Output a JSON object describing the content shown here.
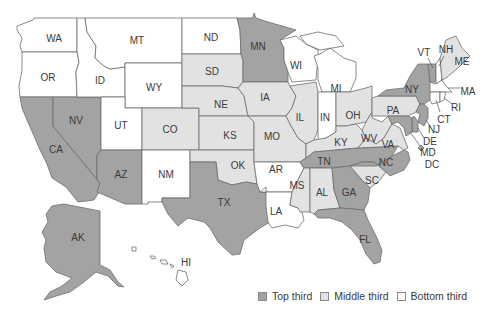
{
  "colors": {
    "top": "#a3a3a3",
    "middle": "#e2e2e2",
    "bottom": "#ffffff",
    "border": "#6d6d6d",
    "label": "#3a3a3a"
  },
  "legend": {
    "items": [
      {
        "key": "top",
        "label": "Top third"
      },
      {
        "key": "middle",
        "label": "Middle third"
      },
      {
        "key": "bottom",
        "label": "Bottom third"
      }
    ]
  },
  "states": [
    {
      "abbr": "WA",
      "tier": "bottom"
    },
    {
      "abbr": "OR",
      "tier": "bottom"
    },
    {
      "abbr": "CA",
      "tier": "top"
    },
    {
      "abbr": "NV",
      "tier": "top"
    },
    {
      "abbr": "ID",
      "tier": "bottom"
    },
    {
      "abbr": "MT",
      "tier": "bottom"
    },
    {
      "abbr": "WY",
      "tier": "bottom"
    },
    {
      "abbr": "UT",
      "tier": "bottom"
    },
    {
      "abbr": "AZ",
      "tier": "top"
    },
    {
      "abbr": "CO",
      "tier": "middle"
    },
    {
      "abbr": "NM",
      "tier": "bottom"
    },
    {
      "abbr": "ND",
      "tier": "bottom"
    },
    {
      "abbr": "SD",
      "tier": "middle"
    },
    {
      "abbr": "NE",
      "tier": "middle"
    },
    {
      "abbr": "KS",
      "tier": "middle"
    },
    {
      "abbr": "OK",
      "tier": "middle"
    },
    {
      "abbr": "TX",
      "tier": "top"
    },
    {
      "abbr": "MN",
      "tier": "top"
    },
    {
      "abbr": "IA",
      "tier": "middle"
    },
    {
      "abbr": "MO",
      "tier": "middle"
    },
    {
      "abbr": "AR",
      "tier": "bottom"
    },
    {
      "abbr": "LA",
      "tier": "bottom"
    },
    {
      "abbr": "WI",
      "tier": "bottom"
    },
    {
      "abbr": "IL",
      "tier": "middle"
    },
    {
      "abbr": "MI",
      "tier": "bottom"
    },
    {
      "abbr": "IN",
      "tier": "bottom"
    },
    {
      "abbr": "OH",
      "tier": "middle"
    },
    {
      "abbr": "KY",
      "tier": "middle"
    },
    {
      "abbr": "TN",
      "tier": "top"
    },
    {
      "abbr": "MS",
      "tier": "middle"
    },
    {
      "abbr": "AL",
      "tier": "middle"
    },
    {
      "abbr": "GA",
      "tier": "top"
    },
    {
      "abbr": "FL",
      "tier": "top"
    },
    {
      "abbr": "SC",
      "tier": "middle"
    },
    {
      "abbr": "NC",
      "tier": "top"
    },
    {
      "abbr": "VA",
      "tier": "middle"
    },
    {
      "abbr": "WV",
      "tier": "middle"
    },
    {
      "abbr": "PA",
      "tier": "middle"
    },
    {
      "abbr": "NY",
      "tier": "top"
    },
    {
      "abbr": "VT",
      "tier": "top"
    },
    {
      "abbr": "NH",
      "tier": "bottom"
    },
    {
      "abbr": "ME",
      "tier": "middle"
    },
    {
      "abbr": "MA",
      "tier": "bottom"
    },
    {
      "abbr": "RI",
      "tier": "bottom"
    },
    {
      "abbr": "CT",
      "tier": "bottom"
    },
    {
      "abbr": "NJ",
      "tier": "top"
    },
    {
      "abbr": "DE",
      "tier": "top"
    },
    {
      "abbr": "MD",
      "tier": "top"
    },
    {
      "abbr": "DC",
      "tier": "top"
    },
    {
      "abbr": "AK",
      "tier": "top"
    },
    {
      "abbr": "HI",
      "tier": "bottom"
    }
  ]
}
